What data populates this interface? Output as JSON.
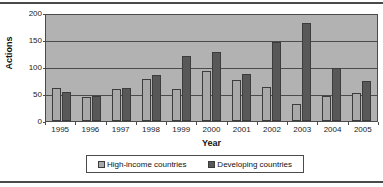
{
  "chart_data": {
    "type": "bar",
    "title": "",
    "xlabel": "Year",
    "ylabel": "Actions",
    "ylim": [
      0,
      200
    ],
    "yticks": [
      0,
      50,
      100,
      150,
      200
    ],
    "grid": true,
    "legend_position": "bottom",
    "categories": [
      "1995",
      "1996",
      "1997",
      "1998",
      "1999",
      "2000",
      "2001",
      "2002",
      "2003",
      "2004",
      "2005"
    ],
    "series": [
      {
        "name": "High-income countries",
        "color": "#a9a9a9",
        "values": [
          62,
          45,
          60,
          80,
          61,
          95,
          77,
          64,
          32,
          48,
          52
        ]
      },
      {
        "name": "Developing countries",
        "color": "#585858",
        "values": [
          55,
          48,
          63,
          87,
          122,
          130,
          88,
          149,
          185,
          100,
          76
        ]
      }
    ]
  },
  "axes": {
    "y_title": "Actions",
    "x_title": "Year",
    "y_tick_labels": [
      "200",
      "150",
      "100",
      "50",
      "0"
    ],
    "x_tick_labels": [
      "1995",
      "1996",
      "1997",
      "1998",
      "1999",
      "2000",
      "2001",
      "2002",
      "2003",
      "2004",
      "2005"
    ]
  },
  "legend": {
    "items": [
      {
        "label": "High-income countries",
        "color": "#a9a9a9"
      },
      {
        "label": "Developing countries",
        "color": "#585858"
      }
    ]
  },
  "style": {
    "plot_background": "#b2b2b2",
    "axis_color": "#4b4b4b",
    "page_background": "#ffffff"
  }
}
